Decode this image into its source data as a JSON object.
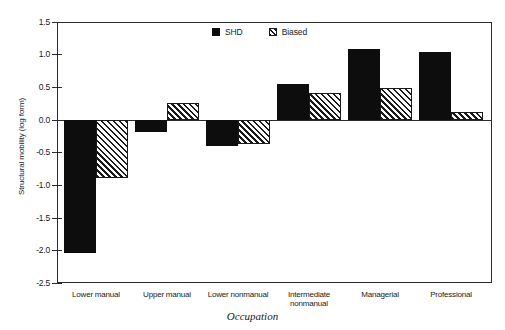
{
  "chart_data": {
    "type": "bar",
    "title": "",
    "xlabel": "Occupation",
    "ylabel": "Structural mobility (log form)",
    "categories": [
      "Lower manual",
      "Upper manual",
      "Lower nonmanual",
      "Intermediate nonmanual",
      "Managerial",
      "Professional"
    ],
    "series": [
      {
        "name": "SHD",
        "fill": "solid-black",
        "values": [
          -2.04,
          -0.18,
          -0.4,
          0.55,
          1.09,
          1.05
        ]
      },
      {
        "name": "Biased",
        "fill": "diagonal-hatch",
        "values": [
          -0.89,
          0.26,
          -0.36,
          0.41,
          0.49,
          0.13
        ]
      }
    ],
    "ylim": [
      -2.5,
      1.5
    ],
    "ytick_step": 0.5,
    "yticks": [
      "1.5",
      "1.0",
      "0.5",
      "0.0",
      "-0.5",
      "-1.0",
      "-1.5",
      "-2.0",
      "-2.5"
    ],
    "grid": false,
    "legend_position": "top-center",
    "zero_line": true
  },
  "legend": {
    "entries": [
      {
        "label": "SHD"
      },
      {
        "label": "Biased"
      }
    ]
  },
  "axis": {
    "y_title": "Structural mobility (log form)",
    "x_title": "Occupation"
  }
}
